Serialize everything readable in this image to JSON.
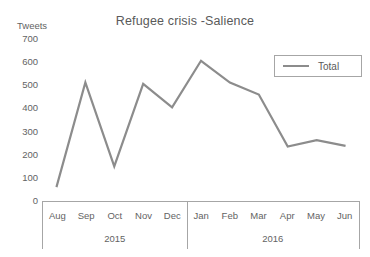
{
  "chart_data": {
    "type": "line",
    "title": "Refugee crisis -Salience",
    "xlabel": "",
    "ylabel": "Tweets",
    "ylim": [
      0,
      700
    ],
    "yticks": [
      0,
      100,
      200,
      300,
      400,
      500,
      600,
      700
    ],
    "grid": false,
    "legend_position": "top-right",
    "categories": [
      "Aug",
      "Sep",
      "Oct",
      "Nov",
      "Dec",
      "Jan",
      "Feb",
      "Mar",
      "Apr",
      "May",
      "Jun"
    ],
    "category_groups": [
      {
        "label": "2015",
        "members": [
          "Aug",
          "Sep",
          "Oct",
          "Nov",
          "Dec"
        ]
      },
      {
        "label": "2016",
        "members": [
          "Jan",
          "Feb",
          "Mar",
          "Apr",
          "May",
          "Jun"
        ]
      }
    ],
    "series": [
      {
        "name": "Total",
        "color": "#8c8c8c",
        "values": [
          60,
          512,
          150,
          506,
          405,
          606,
          512,
          460,
          235,
          263,
          238
        ]
      }
    ]
  },
  "legend": {
    "entries": [
      {
        "label": "Total"
      }
    ]
  },
  "axis_caption": "Tweets"
}
